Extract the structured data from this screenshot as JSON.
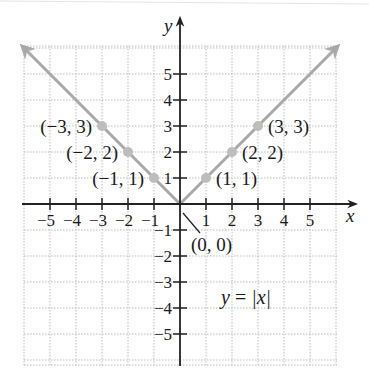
{
  "chart_data": {
    "type": "line",
    "title": "",
    "xlabel": "x",
    "ylabel": "y",
    "xlim": [
      -6,
      6
    ],
    "ylim": [
      -6,
      6
    ],
    "grid": true,
    "x_ticks": [
      -5,
      -4,
      -3,
      -2,
      -1,
      1,
      2,
      3,
      4,
      5
    ],
    "y_ticks": [
      -5,
      -4,
      -3,
      -2,
      -1,
      1,
      2,
      3,
      4,
      5
    ],
    "x_tick_labels": [
      "−5",
      "−4",
      "−3",
      "−2",
      "−1",
      "1",
      "2",
      "3",
      "4",
      "5"
    ],
    "y_tick_labels": [
      "−5",
      "−4",
      "−3",
      "−2",
      "−1",
      "1",
      "2",
      "3",
      "4",
      "5"
    ],
    "series": [
      {
        "name": "y = |x|",
        "function": "abs(x)",
        "x": [
          -6,
          0,
          6
        ],
        "y": [
          6,
          0,
          6
        ],
        "arrows_at_ends": true,
        "color": "#a9a9a9"
      }
    ],
    "points": [
      {
        "x": -3,
        "y": 3,
        "label": "(−3, 3)"
      },
      {
        "x": -2,
        "y": 2,
        "label": "(−2, 2)"
      },
      {
        "x": -1,
        "y": 1,
        "label": "(−1, 1)"
      },
      {
        "x": 0,
        "y": 0,
        "label": "(0, 0)"
      },
      {
        "x": 1,
        "y": 1,
        "label": "(1, 1)"
      },
      {
        "x": 2,
        "y": 2,
        "label": "(2, 2)"
      },
      {
        "x": 3,
        "y": 3,
        "label": "(3, 3)"
      }
    ],
    "annotations": [
      {
        "text": "y = |x|",
        "x": 2.2,
        "y": -3.8
      }
    ]
  },
  "colors": {
    "curve": "#a9a9a9",
    "point": "#bdbdbd",
    "axis": "#222222",
    "grid": "#bdbdbd"
  },
  "labels": {
    "x_axis": "x",
    "y_axis": "y",
    "equation_lhs": "y",
    "equation_eq": " = ",
    "equation_rhs": "|x|"
  }
}
